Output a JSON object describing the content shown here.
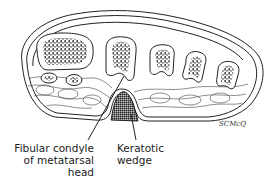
{
  "figure": {
    "labels": {
      "fibular_condyle": [
        "Fibular condyle",
        "of metatarsal",
        "head"
      ],
      "keratotic_wedge": [
        "Keratotic",
        "wedge"
      ]
    },
    "signature": "SCMcQ",
    "colors": {
      "line": "#222222",
      "background": "#ffffff"
    }
  }
}
